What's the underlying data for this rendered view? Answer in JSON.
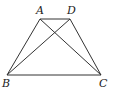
{
  "diagram": {
    "type": "trapezoid",
    "points": {
      "A": {
        "x": 40,
        "y": 19,
        "label": "A",
        "lx": 36,
        "ly": 14
      },
      "D": {
        "x": 70,
        "y": 19,
        "label": "D",
        "lx": 67,
        "ly": 14
      },
      "B": {
        "x": 7,
        "y": 75,
        "label": "B",
        "lx": 2,
        "ly": 87
      },
      "C": {
        "x": 101,
        "y": 75,
        "label": "C",
        "lx": 99,
        "ly": 87
      }
    },
    "segments": [
      {
        "from": "A",
        "to": "D",
        "name": "side-AD"
      },
      {
        "from": "A",
        "to": "B",
        "name": "side-AB"
      },
      {
        "from": "D",
        "to": "C",
        "name": "side-DC"
      },
      {
        "from": "B",
        "to": "C",
        "name": "side-BC"
      },
      {
        "from": "A",
        "to": "C",
        "name": "diagonal-AC"
      },
      {
        "from": "B",
        "to": "D",
        "name": "diagonal-BD"
      }
    ],
    "stroke_color": "#333333"
  }
}
